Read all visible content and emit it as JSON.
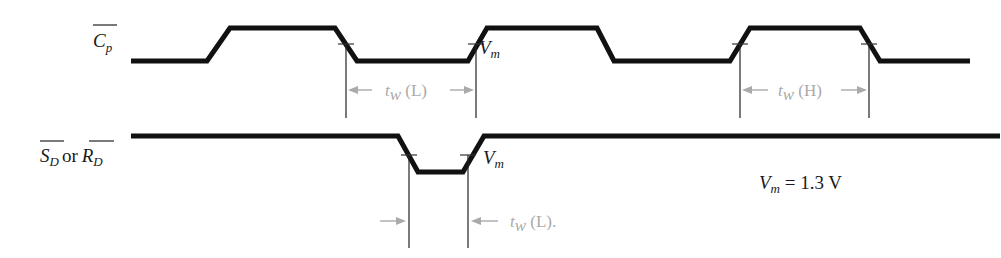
{
  "diagram": {
    "type": "timing-diagram",
    "signals": [
      {
        "id": "cp",
        "label_main": "C",
        "label_sub": "p",
        "overbar": true,
        "high_y": 28,
        "low_y": 61,
        "points": [
          [
            131,
            61
          ],
          [
            207,
            61
          ],
          [
            230,
            28
          ],
          [
            335,
            28
          ],
          [
            357,
            61
          ],
          [
            468,
            61
          ],
          [
            487,
            28
          ],
          [
            597,
            28
          ],
          [
            614,
            61
          ],
          [
            730,
            61
          ],
          [
            750,
            28
          ],
          [
            860,
            28
          ],
          [
            880,
            61
          ],
          [
            970,
            61
          ]
        ]
      },
      {
        "id": "sd-rd",
        "label_s": "S",
        "label_s_sub": "D",
        "label_or": "or",
        "label_r": "R",
        "label_r_sub": "D",
        "overbar": true,
        "high_y": 136,
        "low_y": 172,
        "points": [
          [
            131,
            136
          ],
          [
            398,
            136
          ],
          [
            418,
            172
          ],
          [
            463,
            172
          ],
          [
            484,
            136
          ],
          [
            1000,
            136
          ]
        ]
      }
    ],
    "annotations": {
      "vm_label_main": "V",
      "vm_label_sub": "m",
      "vm_equation_main": "V",
      "vm_equation_sub": "m",
      "vm_equation_value": " = 1.3 V",
      "tw_low_main": "t",
      "tw_low_sub": "w",
      "tw_low_suffix": " (L)",
      "tw_high_main": "t",
      "tw_high_sub": "w",
      "tw_high_suffix": " (H)",
      "tw_low_bottom_suffix": " (L)."
    },
    "measurements": [
      {
        "name": "tw-L-clock",
        "from_x": 346,
        "to_x": 476,
        "arrow_y": 90,
        "style": "inward-label-between"
      },
      {
        "name": "tw-H-clock",
        "from_x": 740,
        "to_x": 869,
        "arrow_y": 90,
        "style": "inward-label-between"
      },
      {
        "name": "tw-L-set-reset",
        "from_x": 409,
        "to_x": 468,
        "arrow_y": 221,
        "style": "outside-arrows"
      }
    ],
    "colors": {
      "signal": "#111111",
      "dimension": "#aaaaaa",
      "text": "#1a1a1a"
    }
  }
}
